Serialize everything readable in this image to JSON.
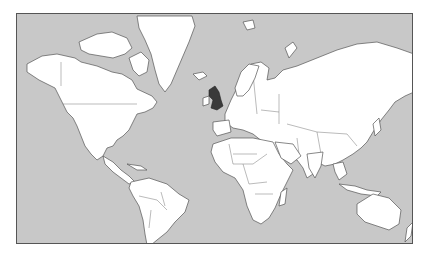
{
  "map": {
    "projection": "Mercator",
    "ocean_color": "#c8c8c8",
    "land_color": "#ffffff",
    "border_color": "#555555",
    "highlight": {
      "region": "United Kingdom",
      "color": "#3a3a3a"
    },
    "continents": [
      "North America",
      "Greenland",
      "South America",
      "Europe",
      "Africa",
      "Asia",
      "Australia",
      "New Zealand",
      "Antarctica-excluded"
    ]
  }
}
